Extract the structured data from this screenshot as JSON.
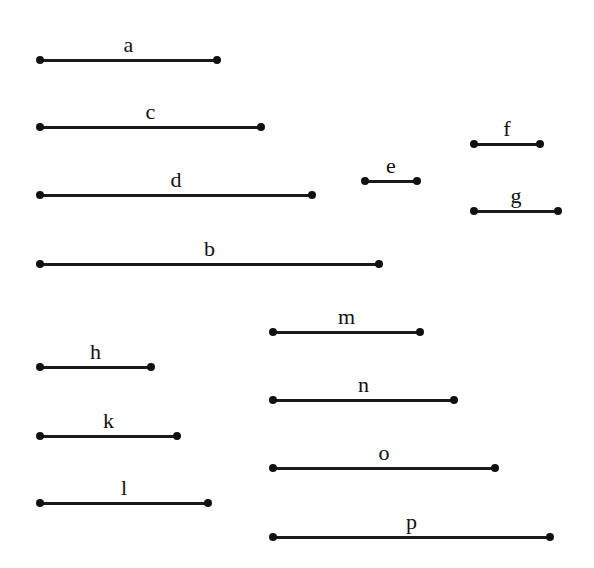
{
  "diagram": {
    "title": "",
    "segments": [
      {
        "label": "a",
        "x1": 40,
        "x2": 217,
        "y": 60
      },
      {
        "label": "c",
        "x1": 40,
        "x2": 261,
        "y": 127
      },
      {
        "label": "d",
        "x1": 40,
        "x2": 312,
        "y": 195
      },
      {
        "label": "b",
        "x1": 40,
        "x2": 379,
        "y": 264
      },
      {
        "label": "e",
        "x1": 365,
        "x2": 417,
        "y": 181
      },
      {
        "label": "f",
        "x1": 474,
        "x2": 540,
        "y": 144
      },
      {
        "label": "g",
        "x1": 474,
        "x2": 558,
        "y": 211
      },
      {
        "label": "m",
        "x1": 273,
        "x2": 420,
        "y": 332
      },
      {
        "label": "n",
        "x1": 273,
        "x2": 454,
        "y": 400
      },
      {
        "label": "o",
        "x1": 273,
        "x2": 495,
        "y": 468
      },
      {
        "label": "p",
        "x1": 273,
        "x2": 550,
        "y": 537
      },
      {
        "label": "h",
        "x1": 40,
        "x2": 151,
        "y": 367
      },
      {
        "label": "k",
        "x1": 40,
        "x2": 177,
        "y": 436
      },
      {
        "label": "l",
        "x1": 40,
        "x2": 208,
        "y": 503
      }
    ],
    "colors": {
      "line": "#1a1a1a",
      "endpoint": "#111111",
      "background": "#ffffff"
    }
  }
}
